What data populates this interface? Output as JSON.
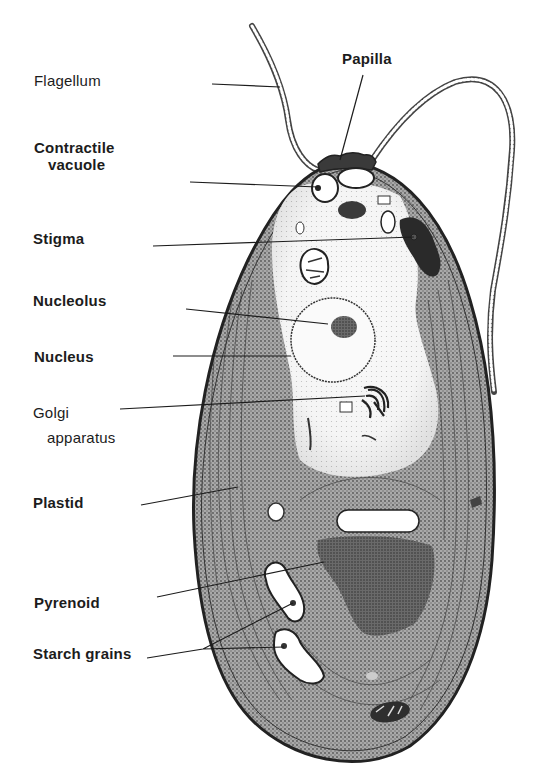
{
  "figure": {
    "labels": [
      {
        "id": "flagellum",
        "text": "Flagellum",
        "x": 34,
        "y": 72,
        "weight": "medium"
      },
      {
        "id": "papilla",
        "text": "Papilla",
        "x": 342,
        "y": 50,
        "weight": "bold"
      },
      {
        "id": "contractile-vacuole",
        "text": "Contractile",
        "text2": "vacuole",
        "x": 34,
        "y": 139,
        "weight": "bold"
      },
      {
        "id": "stigma",
        "text": "Stigma",
        "x": 33,
        "y": 230,
        "weight": "bold"
      },
      {
        "id": "nucleolus",
        "text": "Nucleolus",
        "x": 33,
        "y": 292,
        "weight": "bold"
      },
      {
        "id": "nucleus",
        "text": "Nucleus",
        "x": 34,
        "y": 348,
        "weight": "bold"
      },
      {
        "id": "golgi-apparatus",
        "text": "Golgi",
        "text2": "apparatus",
        "x": 33,
        "y": 400,
        "weight": "medium"
      },
      {
        "id": "plastid",
        "text": "Plastid",
        "x": 33,
        "y": 494,
        "weight": "bold"
      },
      {
        "id": "pyrenoid",
        "text": "Pyrenoid",
        "x": 34,
        "y": 594,
        "weight": "bold"
      },
      {
        "id": "starch-grains",
        "text": "Starch grains",
        "x": 33,
        "y": 645,
        "weight": "bold"
      }
    ]
  },
  "colors": {
    "background": "#ffffff",
    "ink": "#1c1c1c",
    "cytoplasm_light": "#f4f4f4",
    "chloroplast": "#8c8c8c",
    "pyrenoid": "#555555",
    "stigma": "#2a2a2a"
  }
}
